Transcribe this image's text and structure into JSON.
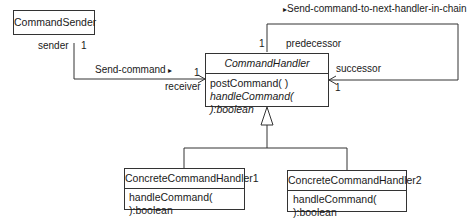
{
  "classes": {
    "sender": {
      "name": "CommandSender"
    },
    "handler": {
      "name": "CommandHandler",
      "ops": [
        "postCommand( )",
        "handleCommand( ):boolean"
      ]
    },
    "concrete1": {
      "name": "ConcreteCommandHandler1",
      "ops": [
        "handleCommand( ):boolean"
      ]
    },
    "concrete2": {
      "name": "ConcreteCommandHandler2",
      "ops": [
        "handleCommand( ):boolean"
      ]
    }
  },
  "associations": {
    "send": {
      "label": "Send-command",
      "arrow": "▸",
      "sender_role": "sender",
      "sender_mult": "1",
      "receiver_role": "receiver",
      "receiver_mult": "1"
    },
    "chain": {
      "label": "Send-command-to-next-handler-in-chain",
      "arrow": "▸",
      "pred_role": "predecessor",
      "pred_mult": "1",
      "succ_role": "successor",
      "succ_mult": "1"
    }
  }
}
